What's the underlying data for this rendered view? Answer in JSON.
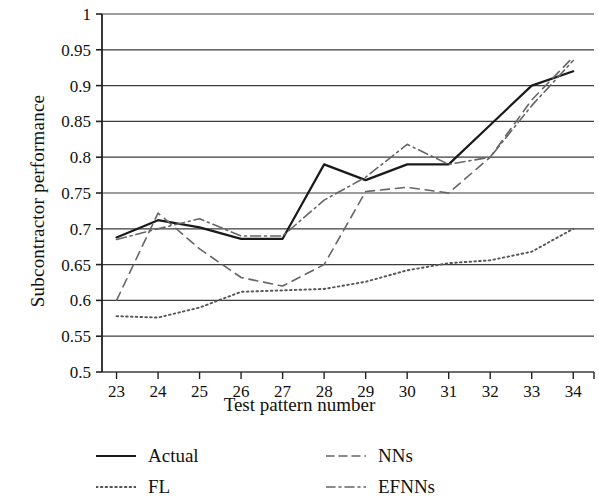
{
  "chart_data": {
    "type": "line",
    "title": "",
    "xlabel": "Test pattern number",
    "ylabel": "Subcontractor performance",
    "x": [
      23,
      24,
      25,
      26,
      27,
      28,
      29,
      30,
      31,
      32,
      33,
      34
    ],
    "xticklabels": [
      "23",
      "24",
      "25",
      "26",
      "27",
      "28",
      "29",
      "30",
      "31",
      "32",
      "33",
      "34"
    ],
    "yticklabels": [
      "0.5",
      "0.55",
      "0.6",
      "0.65",
      "0.7",
      "0.75",
      "0.8",
      "0.85",
      "0.9",
      "0.95",
      "1"
    ],
    "yticks": [
      0.5,
      0.55,
      0.6,
      0.65,
      0.7,
      0.75,
      0.8,
      0.85,
      0.9,
      0.95,
      1
    ],
    "xlim": [
      22.65,
      34.5
    ],
    "ylim": [
      0.5,
      1.0
    ],
    "grid": "horizontal",
    "legend_position": "below-axes",
    "series": [
      {
        "name": "Actual",
        "style": "solid",
        "color": "#1a1a1a",
        "values": [
          0.688,
          0.712,
          0.702,
          0.686,
          0.686,
          0.79,
          0.768,
          0.79,
          0.79,
          0.845,
          0.9,
          0.92
        ]
      },
      {
        "name": "FL",
        "style": "dotted",
        "color": "#555555",
        "values": [
          0.578,
          0.576,
          0.59,
          0.612,
          0.614,
          0.616,
          0.626,
          0.642,
          0.652,
          0.656,
          0.668,
          0.7
        ]
      },
      {
        "name": "NNs",
        "style": "dashed",
        "color": "#666666",
        "values": [
          0.6,
          0.722,
          0.672,
          0.632,
          0.62,
          0.65,
          0.752,
          0.758,
          0.75,
          0.8,
          0.88,
          0.94
        ]
      },
      {
        "name": "EFNNs",
        "style": "dashdot",
        "color": "#666666",
        "values": [
          0.685,
          0.7,
          0.714,
          0.69,
          0.69,
          0.74,
          0.772,
          0.818,
          0.79,
          0.8,
          0.872,
          0.935
        ]
      }
    ]
  },
  "legend": {
    "entries": [
      {
        "label": "Actual",
        "style": "solid"
      },
      {
        "label": "NNs",
        "style": "dashed"
      },
      {
        "label": "FL",
        "style": "dotted"
      },
      {
        "label": "EFNNs",
        "style": "dashdot"
      }
    ]
  }
}
